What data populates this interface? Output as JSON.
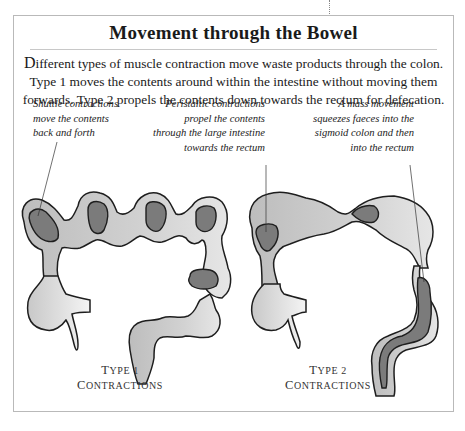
{
  "title": "Movement through the Bowel",
  "intro": {
    "dropcap": "D",
    "text": "ifferent types of muscle contraction move waste products through the colon. Type 1 moves the contents around within the intestine without moving them forwards. Type 2 propels the contents down towards the rectum for defecation."
  },
  "annotations": {
    "shuttle": {
      "lines": [
        "Shuttle contractions",
        "move the contents",
        "back and forth"
      ]
    },
    "peristaltic": {
      "lines": [
        "Peristaltic contractions",
        "propel the contents",
        "through the large intestine",
        "towards the rectum"
      ]
    },
    "mass": {
      "lines": [
        "A mass movement",
        "squeezes faeces into the",
        "sigmoid colon and then",
        "into the rectum"
      ]
    }
  },
  "panels": [
    {
      "label_cap1": "T",
      "label_rest1": "YPE 1 ",
      "label_cap2": "C",
      "label_rest2": "ONTRACTIONS"
    },
    {
      "label_cap1": "T",
      "label_rest1": "YPE 2 ",
      "label_cap2": "C",
      "label_rest2": "ONTRACTIONS"
    }
  ],
  "colors": {
    "intestine_wall": "#c9c9c9",
    "contents": "#7b7b7b",
    "outline": "#1e1e1e",
    "frame_border": "#b9b9b9"
  }
}
